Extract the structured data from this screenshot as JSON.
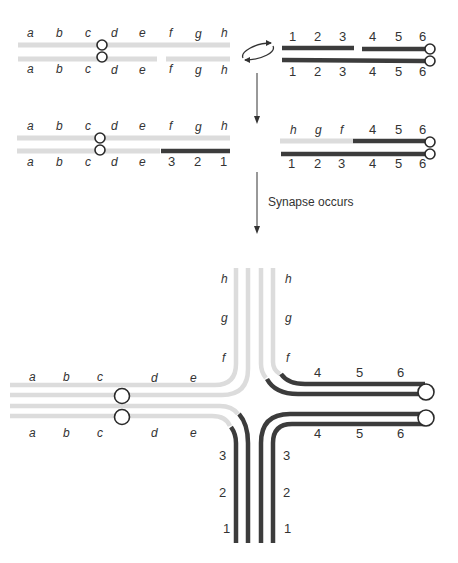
{
  "colors": {
    "light_chromosome": "#dcdcdc",
    "dark_chromosome": "#3c3c3c",
    "centromere_stroke": "#2a2a2a",
    "arrow": "#333333",
    "label": "#333333",
    "background": "#ffffff"
  },
  "stage1": {
    "left_pair": {
      "top_labels": [
        "a",
        "b",
        "c",
        "d",
        "e",
        "f",
        "g",
        "h"
      ],
      "bottom_labels": [
        "a",
        "b",
        "c",
        "d",
        "e",
        "f",
        "g",
        "h"
      ]
    },
    "right_pair": {
      "top_labels": [
        "1",
        "2",
        "3",
        "4",
        "5",
        "6"
      ],
      "bottom_labels": [
        "1",
        "2",
        "3",
        "4",
        "5",
        "6"
      ]
    },
    "exchange_icon": "circular-exchange-arrows-icon"
  },
  "stage2": {
    "left_pair": {
      "top_labels": [
        "a",
        "b",
        "c",
        "d",
        "e",
        "f",
        "g",
        "h"
      ],
      "bottom_labels": [
        "a",
        "b",
        "c",
        "d",
        "e",
        "3",
        "2",
        "1"
      ]
    },
    "right_pair": {
      "top_labels": [
        "h",
        "g",
        "f",
        "4",
        "5",
        "6"
      ],
      "bottom_labels": [
        "1",
        "2",
        "3",
        "4",
        "5",
        "6"
      ]
    }
  },
  "arrows": {
    "arrow1_icon": "down-arrow-icon",
    "arrow2_icon": "down-arrow-icon",
    "arrow2_caption": "Synapse occurs"
  },
  "stage3": {
    "left_arm": {
      "top_labels": [
        "a",
        "b",
        "c",
        "d",
        "e"
      ],
      "bottom_labels": [
        "a",
        "b",
        "c",
        "d",
        "e"
      ]
    },
    "top_arm": {
      "left_labels": [
        "h",
        "g",
        "f"
      ],
      "right_labels": [
        "h",
        "g",
        "f"
      ]
    },
    "right_arm": {
      "top_labels": [
        "4",
        "5",
        "6"
      ],
      "bottom_labels": [
        "4",
        "5",
        "6"
      ]
    },
    "bottom_arm": {
      "left_labels": [
        "3",
        "2",
        "1"
      ],
      "right_labels": [
        "3",
        "2",
        "1"
      ]
    }
  }
}
